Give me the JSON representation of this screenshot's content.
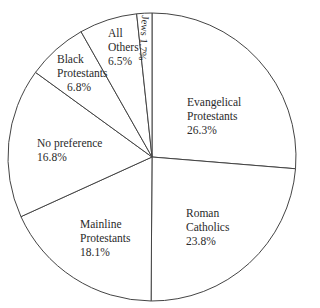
{
  "chart_data": {
    "type": "pie",
    "title": "",
    "start_angle_deg": 0,
    "direction": "clockwise",
    "center": [
      152,
      157
    ],
    "radius": 144,
    "stroke_color": "#444444",
    "fill_color": "#ffffff",
    "slices": [
      {
        "name": "Evangelical Protestants",
        "value": 26.3,
        "label_lines": [
          "Evangelical",
          "Protestants",
          "26.3%"
        ]
      },
      {
        "name": "Roman Catholics",
        "value": 23.8,
        "label_lines": [
          "Roman",
          "Catholics",
          "23.8%"
        ]
      },
      {
        "name": "Mainline Protestants",
        "value": 18.1,
        "label_lines": [
          "Mainline",
          "Protestants",
          "18.1%"
        ]
      },
      {
        "name": "No preference",
        "value": 16.8,
        "label_lines": [
          "No preference",
          "16.8%"
        ]
      },
      {
        "name": "Black Protestants",
        "value": 6.8,
        "label_lines": [
          "Black",
          "Protestants",
          "6.8%"
        ]
      },
      {
        "name": "All Others",
        "value": 6.5,
        "label_lines": [
          "All",
          "Others",
          "6.5%"
        ]
      },
      {
        "name": "Jews",
        "value": 1.7,
        "label_lines": [
          "Jews 1.7%"
        ]
      }
    ]
  },
  "labels": {
    "evangelical": {
      "l1": "Evangelical",
      "l2": "Protestants",
      "l3": "26.3%"
    },
    "catholic": {
      "l1": "Roman",
      "l2": "Catholics",
      "l3": "23.8%"
    },
    "mainline": {
      "l1": "Mainline",
      "l2": "Protestants",
      "l3": "18.1%"
    },
    "nopref": {
      "l1": "No preference",
      "l2": "16.8%"
    },
    "black": {
      "l1": "Black",
      "l2": "Protestants",
      "l3": "6.8%"
    },
    "others": {
      "l1": "All",
      "l2": "Others",
      "l3": "6.5%"
    },
    "jews": {
      "l1": "Jews 1.7%"
    }
  }
}
